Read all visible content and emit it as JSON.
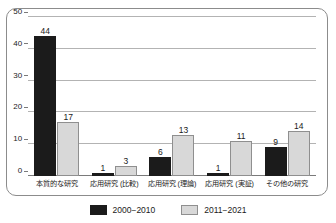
{
  "chart_data": {
    "type": "bar",
    "title": "",
    "subtitle": "",
    "xlabel": "",
    "ylabel": "",
    "ylim": [
      0,
      50
    ],
    "yticks": [
      0,
      10,
      20,
      30,
      40,
      50
    ],
    "ytick_labels": [
      "0",
      "10",
      "20",
      "30",
      "40",
      "50"
    ],
    "grid": true,
    "grid_axis": "y",
    "legend_position": "bottom-center",
    "categories": [
      "本質的な研究",
      "応用研究 (比較)",
      "応用研究 (理論)",
      "応用研究 (実証)",
      "その他の研究"
    ],
    "series": [
      {
        "name": "2000−2010",
        "color": "#1b1b1b",
        "values": [
          44,
          1,
          6,
          1,
          9
        ],
        "value_labels": [
          "44",
          "1",
          "6",
          "1",
          "9"
        ]
      },
      {
        "name": "2011−2021",
        "color": "#d8d8d8",
        "border_color": "#8f8f8f",
        "values": [
          17,
          3,
          13,
          11,
          14
        ],
        "value_labels": [
          "17",
          "3",
          "13",
          "11",
          "14"
        ]
      }
    ]
  },
  "legend": {
    "items": [
      {
        "label": "2000−2010",
        "swatch": "series-a"
      },
      {
        "label": "2011−2021",
        "swatch": "series-b"
      }
    ]
  },
  "colors": {
    "series_a": "#1b1b1b",
    "series_b": "#d8d8d8",
    "series_b_border": "#8f8f8f",
    "gridline": "#b3b3b3",
    "axis": "#7a7a7a",
    "frame_border": "#8c8c8c",
    "text": "#1a1a1a",
    "background": "#ffffff"
  }
}
